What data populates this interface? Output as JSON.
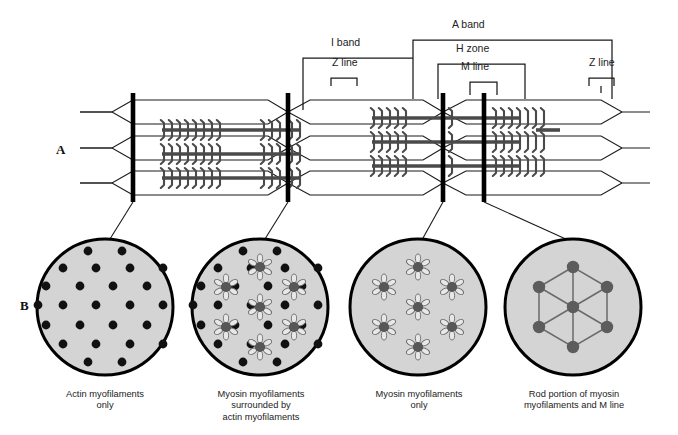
{
  "figure": {
    "panels": [
      {
        "letter": "A",
        "name": "myofibril-longitudinal-section"
      },
      {
        "letter": "B",
        "name": "myofibril-cross-sections"
      }
    ]
  },
  "annotations": {
    "a_band": "A band",
    "i_band": "I band",
    "h_zone": "H zone",
    "m_line": "M line",
    "z_line_left": "Z line",
    "z_line_right": "Z line"
  },
  "cross_sections": [
    {
      "id": "actin-only",
      "caption": "Actin myofilaments\nonly",
      "caption_lines": [
        "Actin myofilaments",
        "only"
      ],
      "actin_count": 24,
      "myosin_count": 0,
      "has_m_line_links": false
    },
    {
      "id": "myosin-surrounded-by-actin",
      "caption": "Myosin myofilaments\nsurrounded by\nactin myofilaments",
      "caption_lines": [
        "Myosin myofilaments",
        "surrounded by",
        "actin myofilaments"
      ],
      "actin_count": 24,
      "myosin_count": 7,
      "has_m_line_links": false
    },
    {
      "id": "myosin-only",
      "caption": "Myosin myofilaments\nonly",
      "caption_lines": [
        "Myosin myofilaments",
        "only"
      ],
      "actin_count": 0,
      "myosin_count": 7,
      "has_m_line_links": false
    },
    {
      "id": "myosin-rod-and-m-line",
      "caption": "Rod portion of myosin\nmyofilaments and M line",
      "caption_lines": [
        "Rod portion of myosin",
        "myofilaments and M line"
      ],
      "actin_count": 0,
      "myosin_count": 7,
      "has_m_line_links": true
    }
  ],
  "colors": {
    "circle_fill": "#d4d4d4",
    "circle_stroke": "#000000",
    "actin_dot": "#111111",
    "myosin_hub": "#575757",
    "filament_dark": "#4a4a4a",
    "line": "#1a1a1a",
    "text": "#222222"
  },
  "structure": {
    "z_line_positions": [
      133,
      288,
      443
    ],
    "m_line_position": 484,
    "myofibril_rows": 3
  }
}
